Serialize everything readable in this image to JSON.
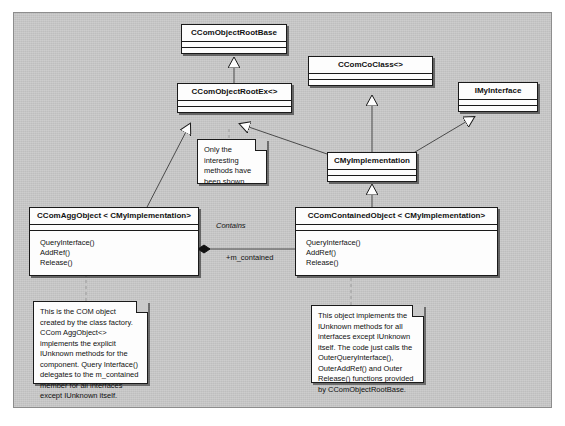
{
  "diagram": {
    "type": "uml-class-diagram",
    "background_color": "#c9c9c9",
    "classes": [
      {
        "id": "ccomobjectrootbase",
        "name": "CComObjectRootBase",
        "methods": []
      },
      {
        "id": "ccomcoclass",
        "name": "CComCoClass<>",
        "methods": []
      },
      {
        "id": "imyinterface",
        "name": "IMyInterface",
        "methods": []
      },
      {
        "id": "ccomobjectrootex",
        "name": "CComObjectRootEx<>",
        "methods": []
      },
      {
        "id": "cmyimplementation",
        "name": "CMyImplementation",
        "methods": []
      },
      {
        "id": "ccomaggobject",
        "name": "CComAggObject < CMyImplementation>",
        "methods": [
          "QueryInterface()",
          "AddRef()",
          "Release()"
        ]
      },
      {
        "id": "ccomcontainedobject",
        "name": "CComContainedObject < CMyImplementation>",
        "methods": [
          "QueryInterface()",
          "AddRef()",
          "Release()"
        ]
      }
    ],
    "notes": [
      {
        "id": "note-only-interesting",
        "text": "Only the interesting methods have been shown."
      },
      {
        "id": "note-com-object",
        "text": "This is the COM object created by the class factory. CCom AggObject<> implements the explicit IUnknown methods for the component. Query Interface() delegates to the m_contained member for all interfaces except IUnknown itself."
      },
      {
        "id": "note-contained-object",
        "text": "This object implements the IUnknown methods for all interfaces except IUnknown itself. The code just calls the OuterQueryInterface(), OuterAddRef() and Outer Release() functions provided by CComObjectRootBase."
      }
    ],
    "associations": [
      {
        "id": "contains",
        "label": "Contains",
        "role_label": "+m_contained",
        "kind": "composition"
      }
    ],
    "generalizations": [
      {
        "from": "CComObjectRootEx<>",
        "to": "CComObjectRootBase"
      },
      {
        "from": "CComAggObject < CMyImplementation>",
        "to": "CComObjectRootEx<>"
      },
      {
        "from": "CMyImplementation",
        "to": "CComObjectRootEx<>"
      },
      {
        "from": "CMyImplementation",
        "to": "CComCoClass<>"
      },
      {
        "from": "CMyImplementation",
        "to": "IMyInterface"
      },
      {
        "from": "CComContainedObject < CMyImplementation>",
        "to": "CMyImplementation"
      }
    ]
  }
}
